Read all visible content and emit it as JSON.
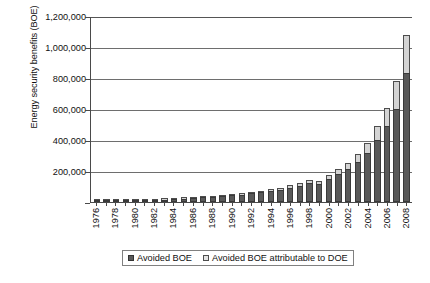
{
  "chart_data": {
    "type": "bar",
    "stacked": true,
    "title": "",
    "xlabel": "",
    "ylabel": "Energy security benefits (BOE)",
    "ylim": [
      0,
      1200000
    ],
    "ytick_values": [
      0,
      200000,
      400000,
      600000,
      800000,
      1000000,
      1200000
    ],
    "ytick_labels": [
      "",
      "200,000",
      "400,000",
      "600,000",
      "800,000",
      "1,000,000",
      "1,200,000"
    ],
    "grid": true,
    "legend_position": "bottom",
    "categories": [
      "1976",
      "1977",
      "1978",
      "1979",
      "1980",
      "1981",
      "1982",
      "1983",
      "1984",
      "1985",
      "1986",
      "1987",
      "1988",
      "1989",
      "1990",
      "1991",
      "1992",
      "1993",
      "1994",
      "1995",
      "1996",
      "1997",
      "1998",
      "1999",
      "2000",
      "2001",
      "2002",
      "2003",
      "2004",
      "2005",
      "2006",
      "2007",
      "2008"
    ],
    "xtick_labels": [
      "1976",
      "",
      "1978",
      "",
      "1980",
      "",
      "1982",
      "",
      "1984",
      "",
      "1986",
      "",
      "1988",
      "",
      "1990",
      "",
      "1992",
      "",
      "1994",
      "",
      "1996",
      "",
      "1998",
      "",
      "2000",
      "",
      "2002",
      "",
      "2004",
      "",
      "2006",
      "",
      "2008"
    ],
    "series": [
      {
        "name": "Avoided BOE",
        "color": "#595959",
        "values": [
          3000,
          4000,
          5500,
          7000,
          9000,
          11000,
          13000,
          16000,
          19000,
          22000,
          26000,
          30000,
          34000,
          38000,
          43000,
          48000,
          55000,
          62000,
          70000,
          80000,
          92000,
          105000,
          120000,
          118000,
          150000,
          180000,
          215000,
          260000,
          315000,
          400000,
          490000,
          600000,
          830000
        ]
      },
      {
        "name": "Avoided BOE attributable to DOE",
        "color": "#d4d4d4",
        "values": [
          500,
          700,
          900,
          1200,
          1500,
          1800,
          2200,
          2600,
          3000,
          3500,
          4000,
          4600,
          5200,
          5800,
          6500,
          7200,
          8500,
          9500,
          11000,
          13000,
          15000,
          18000,
          21000,
          20000,
          26000,
          32000,
          40000,
          52000,
          68000,
          90000,
          115000,
          180000,
          245000
        ]
      }
    ],
    "legend_entries": [
      {
        "label": "Avoided BOE",
        "swatch": "base"
      },
      {
        "label": "Avoided BOE attributable to DOE",
        "swatch": "doe"
      }
    ]
  }
}
